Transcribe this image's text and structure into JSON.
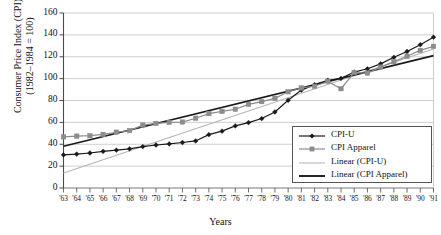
{
  "chart_data": {
    "type": "line",
    "title": "",
    "xlabel": "Years",
    "ylabel": "Consumer Price Index (CPI)\n(1982–1984 = 100)",
    "xlim": [
      1963,
      1991
    ],
    "ylim": [
      0,
      160
    ],
    "ytick_step": 20,
    "grid": true,
    "legend_position": "inside-right",
    "categories": [
      "'63",
      "'64",
      "'65",
      "'66",
      "'67",
      "'68",
      "'69",
      "'70",
      "'71",
      "'72",
      "'73",
      "'74",
      "'75",
      "'76",
      "'77",
      "'78",
      "'79",
      "'80",
      "'81",
      "'82",
      "'83",
      "'84",
      "'85",
      "'86",
      "'87",
      "'88",
      "'89",
      "'90",
      "'91"
    ],
    "yticks": [
      0,
      20,
      40,
      60,
      80,
      100,
      120,
      140,
      160
    ],
    "ytick_labels": [
      "0",
      "20",
      "40",
      "60",
      "80",
      "100",
      "120",
      "140",
      "160"
    ],
    "series": [
      {
        "name": "CPI-U",
        "marker": "diamond",
        "color": "#1a1a1a",
        "values": [
          30.3,
          31.0,
          32.0,
          33.5,
          34.6,
          35.8,
          37.9,
          39.3,
          40.3,
          41.6,
          43.0,
          48.8,
          52.0,
          56.8,
          59.8,
          63.5,
          69.5,
          80.2,
          89.5,
          94.5,
          98.5,
          100.3,
          106.0,
          109.0,
          113.5,
          119.5,
          124.8,
          131.0,
          137.9
        ]
      },
      {
        "name": "CPI Apparel",
        "marker": "square",
        "color": "#8c8c8c",
        "values": [
          46.8,
          47.4,
          47.8,
          49.0,
          51.0,
          52.5,
          57.5,
          59.0,
          60.0,
          60.3,
          63.8,
          68.0,
          70.0,
          72.0,
          76.5,
          79.0,
          82.0,
          88.0,
          91.5,
          93.0,
          97.5,
          90.8,
          105.5,
          105.0,
          110.5,
          115.5,
          120.5,
          125.8,
          129.5
        ]
      }
    ],
    "trendlines": [
      {
        "name": "Linear (CPI-U)",
        "color": "#b5b5b5",
        "start_value": 13.8,
        "end_value": 127.0
      },
      {
        "name": "Linear (CPI Apparel)",
        "color": "#1a1a1a",
        "start_value": 38.2,
        "end_value": 121.0
      }
    ],
    "legend": [
      {
        "label": "CPI-U",
        "style": "line-diamond",
        "color": "#1a1a1a"
      },
      {
        "label": "CPI Apparel",
        "style": "line-square",
        "color": "#8c8c8c"
      },
      {
        "label": "Linear (CPI-U)",
        "style": "line",
        "color": "#b5b5b5"
      },
      {
        "label": "Linear (CPI Apparel)",
        "style": "line-thick",
        "color": "#1a1a1a"
      }
    ]
  }
}
